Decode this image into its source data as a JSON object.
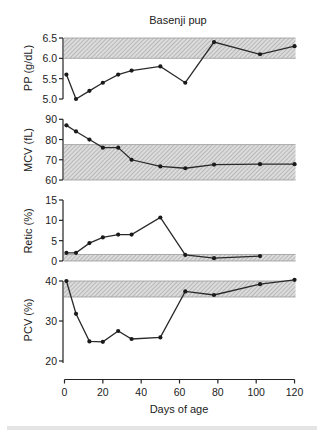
{
  "chart_data": {
    "type": "line",
    "title": "Basenji pup",
    "xlabel": "Days of age",
    "x_ticks": [
      0,
      20,
      40,
      60,
      80,
      100,
      120
    ],
    "xlim": [
      0,
      120
    ],
    "legend": null,
    "grid": false,
    "panels": [
      {
        "id": "pp",
        "ylabel": "PP (g/dL)",
        "ylim": [
          5.0,
          6.5
        ],
        "y_ticks": [
          5.0,
          5.5,
          6.0,
          6.5
        ],
        "y_tick_labels": [
          "5.0",
          "5.5",
          "6.0",
          "6.5"
        ],
        "reference_band": [
          6.0,
          6.5
        ],
        "x": [
          1,
          6,
          13,
          20,
          28,
          35,
          50,
          63,
          78,
          102,
          120
        ],
        "values": [
          5.6,
          5.0,
          5.2,
          5.4,
          5.6,
          5.7,
          5.8,
          5.4,
          6.4,
          6.1,
          6.3
        ]
      },
      {
        "id": "mcv",
        "ylabel": "MCV (fL)",
        "ylim": [
          60,
          90
        ],
        "y_ticks": [
          60,
          70,
          80,
          90
        ],
        "y_tick_labels": [
          "60",
          "70",
          "80",
          "90"
        ],
        "reference_band": [
          60,
          77.5
        ],
        "x": [
          1,
          6,
          13,
          20,
          28,
          35,
          50,
          63,
          78,
          102,
          120
        ],
        "values": [
          87,
          84,
          80,
          76,
          76,
          70,
          66.7,
          65.8,
          67.6,
          67.8,
          67.8
        ]
      },
      {
        "id": "retic",
        "ylabel": "Retic (%)",
        "ylim": [
          0,
          15
        ],
        "y_ticks": [
          0,
          5,
          10,
          15
        ],
        "y_tick_labels": [
          "0",
          "5",
          "10",
          "15"
        ],
        "reference_band": [
          0,
          1.6
        ],
        "x": [
          1,
          6,
          13,
          20,
          28,
          35,
          50,
          63,
          78,
          102
        ],
        "values": [
          2.0,
          2.0,
          4.4,
          5.8,
          6.5,
          6.5,
          10.7,
          1.5,
          0.7,
          1.2
        ]
      },
      {
        "id": "pcv",
        "ylabel": "PCV (%)",
        "ylim": [
          20,
          40
        ],
        "y_ticks": [
          20,
          30,
          40
        ],
        "y_tick_labels": [
          "20",
          "30",
          "40"
        ],
        "reference_band": [
          36,
          40
        ],
        "x": [
          1,
          6,
          13,
          20,
          28,
          35,
          50,
          63,
          78,
          102,
          120
        ],
        "values": [
          40,
          31.8,
          24.9,
          24.8,
          27.5,
          25.5,
          25.9,
          37.4,
          36.5,
          39.2,
          40.3
        ]
      }
    ]
  },
  "colors": {
    "line": "#2a2a2a",
    "band_fill": "#d9d9d9",
    "band_hatch": "#8c8c8c",
    "axis": "#222222"
  }
}
